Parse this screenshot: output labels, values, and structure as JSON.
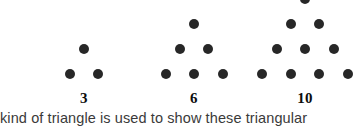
{
  "figure": {
    "kind": "triangular-number-dot-diagram",
    "width": 356,
    "height": 126,
    "background_color": "#ffffff",
    "dot_color": "#272727",
    "dot_diameter": 10,
    "column_spacing": 28.5,
    "row_spacing": 25,
    "label_color": "#0d0d0d"
  },
  "groups": [
    {
      "name": "triangle-3",
      "label": "3",
      "dot_count": 3,
      "rows": [
        1,
        2
      ],
      "center_x": 84,
      "baseline_y": 74,
      "label_x": 84,
      "label_y": 91,
      "clipped_top": false
    },
    {
      "name": "triangle-6",
      "label": "6",
      "dot_count": 6,
      "rows": [
        1,
        2,
        3
      ],
      "center_x": 194,
      "baseline_y": 74,
      "label_x": 194,
      "label_y": 91,
      "clipped_top": false
    },
    {
      "name": "triangle-10",
      "label": "10",
      "dot_count": 10,
      "rows": [
        1,
        2,
        3,
        4
      ],
      "center_x": 305,
      "baseline_y": 74,
      "label_x": 305,
      "label_y": 91,
      "clipped_top": true
    }
  ],
  "caption": {
    "text": "kind of triangle is used to show these triangular",
    "clipped": true,
    "color": "#3a3a3a"
  },
  "chart_data": {
    "type": "scatter",
    "title": "",
    "xlabel": "",
    "ylabel": "",
    "categories": [
      "3",
      "6",
      "10"
    ],
    "values": [
      3,
      6,
      10
    ],
    "series": [
      {
        "name": "triangular numbers",
        "values": [
          3,
          6,
          10
        ],
        "row_structure": [
          [
            1,
            2
          ],
          [
            1,
            2,
            3
          ],
          [
            1,
            2,
            3,
            4
          ]
        ]
      }
    ],
    "annotations": [
      "3",
      "6",
      "10",
      "kind of triangle is used to show these triangular"
    ],
    "grid": false,
    "legend": "none"
  }
}
